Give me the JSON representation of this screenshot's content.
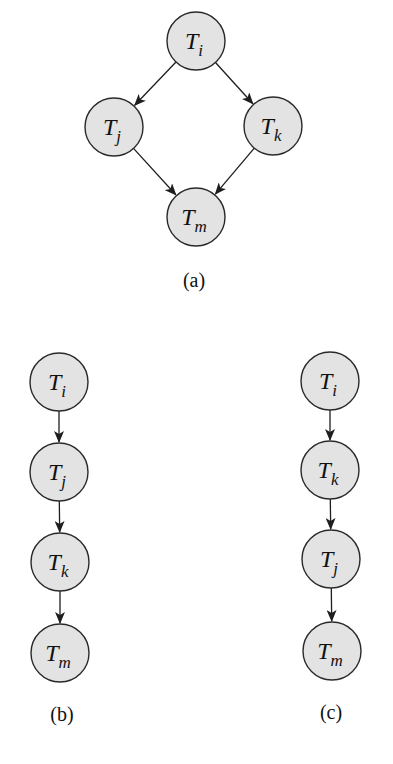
{
  "diagram": {
    "node_radius": 29,
    "colors": {
      "node_fill": "#e3e3e3",
      "node_stroke": "#2a2a2a",
      "edge": "#1e1e1e",
      "text": "#111111"
    },
    "subfigures": [
      {
        "id": "a",
        "caption": "(a)",
        "caption_pos": [
          194,
          287
        ],
        "nodes": [
          {
            "id": "a-Ti",
            "base": "T",
            "sub": "i",
            "cx": 196,
            "cy": 41
          },
          {
            "id": "a-Tj",
            "base": "T",
            "sub": "j",
            "cx": 114,
            "cy": 127
          },
          {
            "id": "a-Tk",
            "base": "T",
            "sub": "k",
            "cx": 273,
            "cy": 126
          },
          {
            "id": "a-Tm",
            "base": "T",
            "sub": "m",
            "cx": 196,
            "cy": 217
          }
        ],
        "edges": [
          {
            "from": "a-Ti",
            "to": "a-Tj"
          },
          {
            "from": "a-Ti",
            "to": "a-Tk"
          },
          {
            "from": "a-Tj",
            "to": "a-Tm"
          },
          {
            "from": "a-Tk",
            "to": "a-Tm"
          }
        ]
      },
      {
        "id": "b",
        "caption": "(b)",
        "caption_pos": [
          62,
          721
        ],
        "nodes": [
          {
            "id": "b-Ti",
            "base": "T",
            "sub": "i",
            "cx": 59,
            "cy": 382
          },
          {
            "id": "b-Tj",
            "base": "T",
            "sub": "j",
            "cx": 59,
            "cy": 472
          },
          {
            "id": "b-Tk",
            "base": "T",
            "sub": "k",
            "cx": 60,
            "cy": 562
          },
          {
            "id": "b-Tm",
            "base": "T",
            "sub": "m",
            "cx": 60,
            "cy": 653
          }
        ],
        "edges": [
          {
            "from": "b-Ti",
            "to": "b-Tj"
          },
          {
            "from": "b-Tj",
            "to": "b-Tk"
          },
          {
            "from": "b-Tk",
            "to": "b-Tm"
          }
        ]
      },
      {
        "id": "c",
        "caption": "(c)",
        "caption_pos": [
          331,
          719
        ],
        "nodes": [
          {
            "id": "c-Ti",
            "base": "T",
            "sub": "i",
            "cx": 330,
            "cy": 381
          },
          {
            "id": "c-Tk",
            "base": "T",
            "sub": "k",
            "cx": 330,
            "cy": 470
          },
          {
            "id": "c-Tj",
            "base": "T",
            "sub": "j",
            "cx": 331,
            "cy": 559
          },
          {
            "id": "c-Tm",
            "base": "T",
            "sub": "m",
            "cx": 332,
            "cy": 651
          }
        ],
        "edges": [
          {
            "from": "c-Ti",
            "to": "c-Tk"
          },
          {
            "from": "c-Tk",
            "to": "c-Tj"
          },
          {
            "from": "c-Tj",
            "to": "c-Tm"
          }
        ]
      }
    ]
  }
}
